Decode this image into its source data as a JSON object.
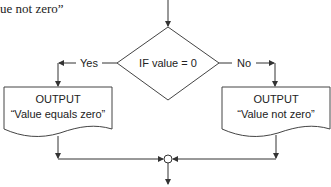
{
  "top_fragment": "ue not zero”",
  "flowchart": {
    "decision": {
      "label": "IF value = 0"
    },
    "branch_yes": {
      "label": "Yes"
    },
    "branch_no": {
      "label": "No"
    },
    "output_yes": {
      "title": "OUTPUT",
      "text": "“Value equals zero”"
    },
    "output_no": {
      "title": "OUTPUT",
      "text": "“Value not zero”"
    }
  },
  "colors": {
    "line": "#333333",
    "text": "#222222",
    "background": "#ffffff"
  }
}
